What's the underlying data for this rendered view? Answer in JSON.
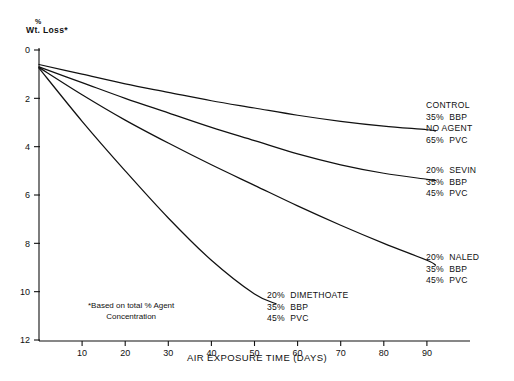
{
  "chart_data": {
    "type": "line",
    "title": "",
    "xlabel": "AIR EXPOSURE TIME (DAYS)",
    "ylabel": "% Wt. Loss*",
    "ylabel_top": "%",
    "ylabel_main": "Wt. Loss*",
    "footnote": "*Based on total % Agent",
    "footnote_line2": "Concentration",
    "xlim": [
      0,
      100
    ],
    "ylim": [
      0,
      12
    ],
    "y_inverted": true,
    "grid": false,
    "legend_position": "inline-right-annotations",
    "xticks": [
      10,
      20,
      30,
      40,
      50,
      60,
      70,
      80,
      90
    ],
    "yticks": [
      0,
      2,
      4,
      6,
      8,
      10,
      12
    ],
    "x": [
      0,
      10,
      20,
      30,
      40,
      50,
      60,
      70,
      80,
      90,
      92
    ],
    "series": [
      {
        "name": "CONTROL",
        "label_lines": [
          "CONTROL",
          "35%  BBP",
          "NO AGENT",
          "65%  PVC"
        ],
        "values": [
          0.6,
          1.0,
          1.4,
          1.75,
          2.1,
          2.4,
          2.7,
          2.95,
          3.15,
          3.3,
          3.35
        ]
      },
      {
        "name": "20% SEVIN",
        "label_lines": [
          "20%  SEVIN",
          "35%  BBP",
          "45%  PVC"
        ],
        "values": [
          0.7,
          1.35,
          2.0,
          2.6,
          3.2,
          3.75,
          4.3,
          4.75,
          5.1,
          5.35,
          5.4
        ]
      },
      {
        "name": "20% NALED",
        "label_lines": [
          "20%  NALED",
          "35%  BBP",
          "45%  PVC"
        ],
        "values": [
          0.72,
          1.85,
          2.9,
          3.85,
          4.75,
          5.6,
          6.45,
          7.25,
          8.0,
          8.7,
          8.9
        ]
      },
      {
        "name": "20% DIMETHOATE",
        "label_lines": [
          "20%  DIMETHOATE",
          "35%  BBP",
          "45%  PVC"
        ],
        "x": [
          0,
          10,
          20,
          30,
          40,
          50,
          55
        ],
        "values": [
          0.75,
          2.95,
          5.0,
          6.95,
          8.7,
          10.1,
          10.5
        ]
      }
    ]
  },
  "annotations": {
    "control": {
      "l1": "CONTROL",
      "l2": "35%  BBP",
      "l3": "NO AGENT",
      "l4": "65%  PVC"
    },
    "sevin": {
      "l1": "20%  SEVIN",
      "l2": "35%  BBP",
      "l3": "45%  PVC"
    },
    "naled": {
      "l1": "20%  NALED",
      "l2": "35%  BBP",
      "l3": "45%  PVC"
    },
    "dimethoate": {
      "l1": "20%  DIMETHOATE",
      "l2": "35%  BBP",
      "l3": "45%  PVC"
    },
    "footnote": {
      "l1": "*Based on total % Agent",
      "l2": "Concentration"
    }
  },
  "axis": {
    "x_title": "AIR EXPOSURE TIME (DAYS)",
    "y_title_top": "%",
    "y_title_main": "Wt. Loss*",
    "xticks": [
      "10",
      "20",
      "30",
      "40",
      "50",
      "60",
      "70",
      "80",
      "90"
    ],
    "yticks": [
      "0",
      "2",
      "4",
      "6",
      "8",
      "10",
      "12"
    ]
  }
}
